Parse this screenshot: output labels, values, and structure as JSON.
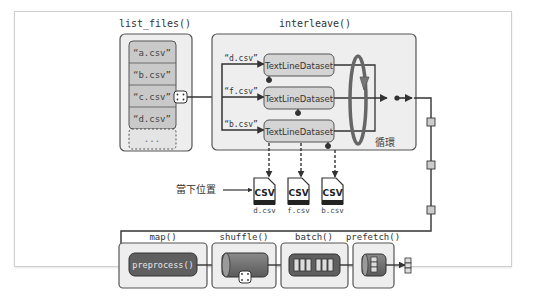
{
  "stages": {
    "list_files": {
      "title": "list_files()",
      "items": [
        "“a.csv”",
        "“b.csv”",
        "“c.csv”",
        "“d.csv”",
        "..."
      ]
    },
    "interleave": {
      "title": "interleave()",
      "inputs": [
        "“d.csv”",
        "“f.csv”",
        "“b.csv”"
      ],
      "dataset_label": "TextLineDataset",
      "loop_label": "循環"
    },
    "files": {
      "pointer_label": "當下位置",
      "icon_text": "CSV",
      "names": [
        "d.csv",
        "f.csv",
        "b.csv"
      ]
    },
    "map": {
      "title": "map()",
      "op_label": "preprocess()"
    },
    "shuffle": {
      "title": "shuffle()"
    },
    "batch": {
      "title": "batch()"
    },
    "prefetch": {
      "title": "prefetch()"
    }
  },
  "icons": {
    "dice": "dice-icon",
    "csv_file": "csv-file-icon",
    "loop": "loop-arrow-icon",
    "record": "record-square-icon"
  },
  "colors": {
    "panel_fill": "#eeeeee",
    "panel_stroke": "#555555",
    "item_fill": "#c9c9c9",
    "dataset_fill": "#d4d4d4",
    "op_fill": "#5f5f5f",
    "line": "#333333",
    "loop": "#666666"
  }
}
